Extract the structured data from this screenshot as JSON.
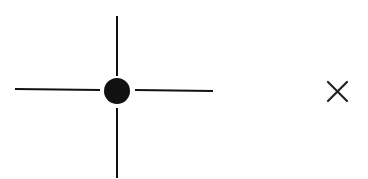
{
  "figure": {
    "elements": [
      {
        "name": "crosshair",
        "description": "four line segments around a filled dot"
      },
      {
        "name": "close-mark",
        "description": "x glyph"
      }
    ],
    "colors": {
      "stroke": "#111111",
      "background": "#ffffff"
    }
  }
}
